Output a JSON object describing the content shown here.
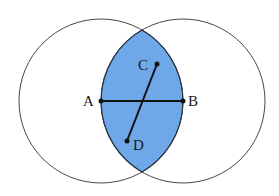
{
  "diagram": {
    "colors": {
      "lens_fill": "#6fa8e8",
      "circle_stroke": "#333333",
      "segment_stroke": "#111111",
      "background": "#ffffff"
    },
    "circles": [
      {
        "name": "left-circle",
        "cx": 101,
        "cy": 101,
        "r": 82
      },
      {
        "name": "right-circle",
        "cx": 183,
        "cy": 101,
        "r": 82
      }
    ],
    "points": {
      "A": {
        "label": "A",
        "x": 101,
        "y": 101
      },
      "B": {
        "label": "B",
        "x": 183,
        "y": 101
      },
      "C": {
        "label": "C",
        "x": 157,
        "y": 64
      },
      "D": {
        "label": "D",
        "x": 127,
        "y": 141
      }
    },
    "segments": [
      {
        "from": "A",
        "to": "B"
      },
      {
        "from": "C",
        "to": "D"
      }
    ]
  }
}
